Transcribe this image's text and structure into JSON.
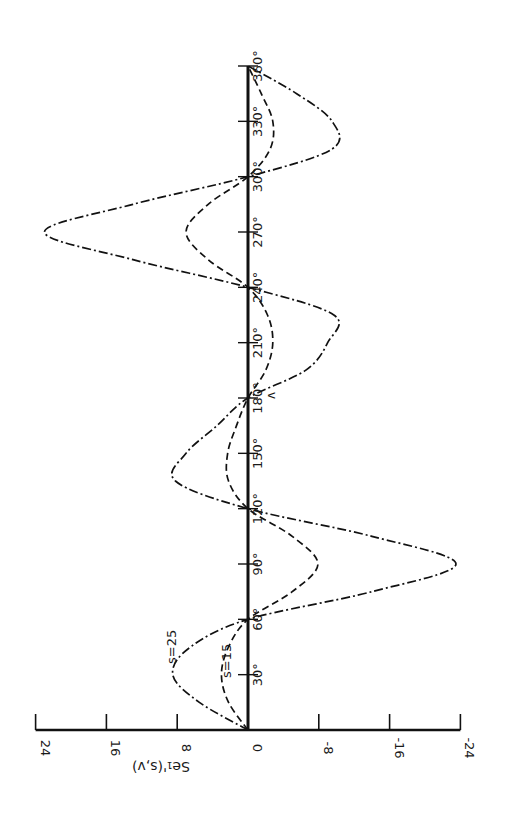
{
  "chart_data": {
    "type": "line",
    "title": "",
    "xlabel": "v",
    "ylabel": "Se1'(s,v)",
    "orientation": "rotated-90-ccw",
    "xlim": [
      0,
      360
    ],
    "ylim": [
      -24,
      24
    ],
    "x_ticks": [
      "30°",
      "60°",
      "90°",
      "120°",
      "150°",
      "180°",
      "210°",
      "240°",
      "270°",
      "300°",
      "330°",
      "360°"
    ],
    "y_ticks": [
      "24",
      "16",
      "8",
      "0",
      "-8",
      "-16",
      "-24"
    ],
    "grid": false,
    "legend": "inline annotations",
    "x": [
      0,
      15,
      30,
      45,
      60,
      75,
      90,
      105,
      120,
      135,
      150,
      165,
      180,
      195,
      210,
      225,
      240,
      255,
      270,
      285,
      300,
      315,
      330,
      345,
      360
    ],
    "series": [
      {
        "name": "s=25",
        "style": "dash-dot",
        "values": [
          0,
          5.5,
          8.5,
          6.5,
          0,
          -14,
          -23.5,
          -14,
          0,
          8.2,
          7,
          3.5,
          0,
          -6.5,
          -9,
          -9.7,
          0,
          13,
          23,
          13,
          0,
          -9.5,
          -9.5,
          -5.5,
          0
        ]
      },
      {
        "name": "s=15",
        "style": "dashed",
        "values": [
          0,
          2.2,
          3,
          2.2,
          0,
          -5,
          -7.9,
          -5,
          0,
          2.2,
          2.3,
          1.3,
          0,
          -2,
          -2.8,
          -2.2,
          0,
          4.5,
          7,
          4.5,
          0,
          -2.5,
          -2.8,
          -1.5,
          0
        ]
      }
    ],
    "annotations": [
      {
        "text": "s=25",
        "at_x": 35,
        "at_y": 9.5
      },
      {
        "text": "s=15",
        "at_x": 30,
        "at_y": 3.5
      }
    ]
  },
  "labels": {
    "ylabel": "Se₁'(s,v)",
    "xlabel": "v",
    "s25": "s=25",
    "s15": "s=15"
  }
}
